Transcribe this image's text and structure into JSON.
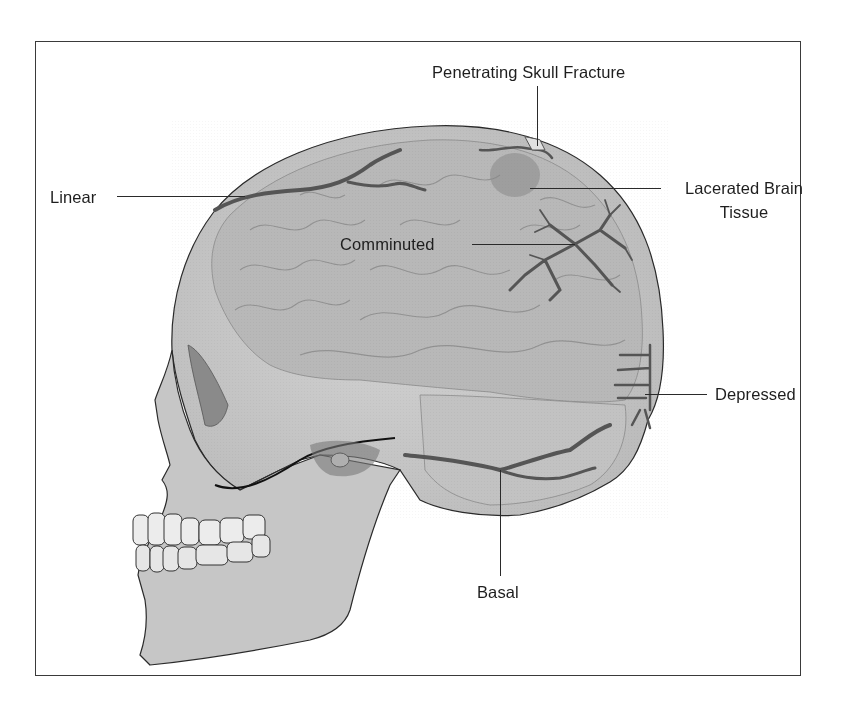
{
  "figure": {
    "colors": {
      "frame": "#3a3a3a",
      "skull_fill": "#c8c8c8",
      "brain_fill": "#b4b4b4",
      "fracture": "#555555",
      "teeth": "#ececec",
      "label_text": "#1e1e1e"
    }
  },
  "labels": {
    "penetrating": "Penetrating Skull Fracture",
    "lacerated_line1": "Lacerated Brain",
    "lacerated_line2": "Tissue",
    "linear": "Linear",
    "comminuted": "Comminuted",
    "depressed": "Depressed",
    "basal": "Basal"
  }
}
